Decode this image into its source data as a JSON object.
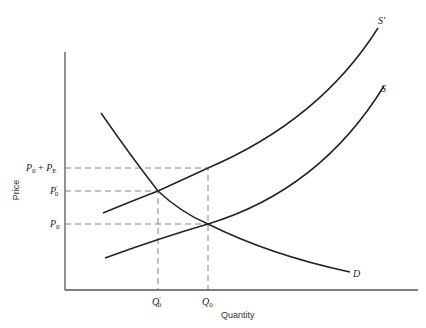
{
  "diagram": {
    "axes": {
      "x_label": "Quantity",
      "y_label": "Price"
    },
    "price_ticks": [
      {
        "id": "p0_plus_pe",
        "base": "P",
        "sub": "0",
        "middle": " + ",
        "base2": "P",
        "sub2": "E"
      },
      {
        "id": "p0_prime",
        "base": "P",
        "prime": "′",
        "sub": "0"
      },
      {
        "id": "p0",
        "base": "P",
        "sub": "0"
      }
    ],
    "quantity_ticks": [
      {
        "id": "q0_prime",
        "base": "Q",
        "prime": "′",
        "sub": "0"
      },
      {
        "id": "q0",
        "base": "Q",
        "sub": "0"
      }
    ],
    "curves": {
      "s_prime": {
        "label": "S′"
      },
      "s": {
        "label": "S"
      },
      "d": {
        "label": "D"
      }
    },
    "colors": {
      "curve": "#222222",
      "axis": "#555555",
      "guide": "#777777"
    }
  }
}
